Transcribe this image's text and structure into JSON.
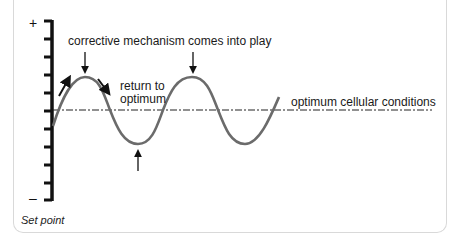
{
  "diagram": {
    "type": "homeostasis-negative-feedback",
    "axis": {
      "plus_label": "+",
      "minus_label": "–",
      "tick_count": 11
    },
    "baseline_label": "optimum cellular conditions",
    "annotations": {
      "corrective": "corrective mechanism comes into play",
      "return_line1": "return to",
      "return_line2": "optimum"
    },
    "footer_label": "Set point",
    "colors": {
      "wave": "#6b6b6b",
      "axis": "#111111",
      "border": "#d9d9d9"
    }
  }
}
